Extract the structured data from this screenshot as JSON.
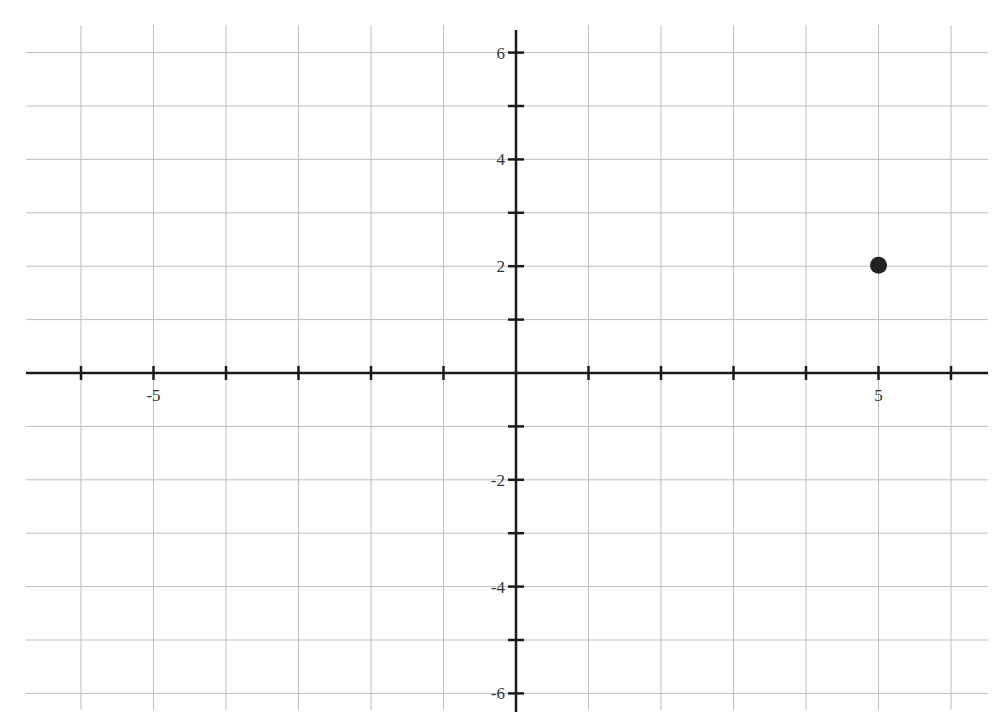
{
  "chart_data": {
    "type": "scatter",
    "title": "",
    "xlabel": "",
    "ylabel": "",
    "xlim": [
      -6.8,
      6.5
    ],
    "ylim": [
      -6.4,
      6.5
    ],
    "grid": true,
    "x_grid_step": 1,
    "y_grid_step": 1,
    "x_tick_labels": [
      {
        "value": -5,
        "label": "-5"
      },
      {
        "value": 5,
        "label": "5"
      }
    ],
    "y_tick_labels": [
      {
        "value": 6,
        "label": "6"
      },
      {
        "value": 4,
        "label": "4"
      },
      {
        "value": 2,
        "label": "2"
      },
      {
        "value": -2,
        "label": "-2"
      },
      {
        "value": -4,
        "label": "-4"
      },
      {
        "value": -6,
        "label": "-6"
      }
    ],
    "series": [
      {
        "name": "point",
        "points": [
          {
            "x": 5,
            "y": 2
          }
        ],
        "color": "#222222"
      }
    ],
    "legend": null
  },
  "style": {
    "grid_color": "#bdbdbd",
    "axis_color": "#1a1a1a",
    "point_color": "#222222"
  }
}
